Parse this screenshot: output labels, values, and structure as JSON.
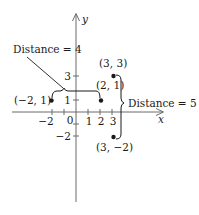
{
  "diagram": {
    "type": "coordinate-plane-distance",
    "axes": {
      "x_label": "x",
      "y_label": "y",
      "x_ticks": [
        {
          "value": -2,
          "label": "−2"
        },
        {
          "value": -1,
          "label": ""
        },
        {
          "value": 0,
          "label": "0"
        },
        {
          "value": 1,
          "label": "1"
        },
        {
          "value": 2,
          "label": "2"
        },
        {
          "value": 3,
          "label": "3"
        }
      ],
      "y_ticks": [
        {
          "value": 3,
          "label": "3"
        },
        {
          "value": 1,
          "label": "1"
        },
        {
          "value": -1,
          "label": ""
        },
        {
          "value": -2,
          "label": "−2"
        }
      ]
    },
    "points": [
      {
        "id": "p1",
        "x": -2,
        "y": 1,
        "label": "(−2, 1)"
      },
      {
        "id": "p2",
        "x": 2,
        "y": 1,
        "label": "(2, 1)"
      },
      {
        "id": "p3",
        "x": 3,
        "y": 3,
        "label": "(3, 3)"
      },
      {
        "id": "p4",
        "x": 3,
        "y": -2,
        "label": "(3, −2)"
      }
    ],
    "annotations": {
      "horizontal_distance": "Distance = 4",
      "vertical_distance": "Distance = 5"
    },
    "colors": {
      "ink": "#1a1a1a",
      "axis": "#6b6b6b",
      "background": "#ffffff"
    }
  }
}
